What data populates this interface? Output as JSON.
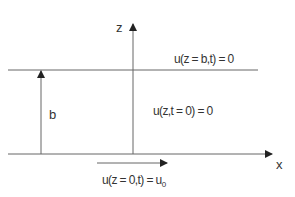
{
  "diagram": {
    "axes": {
      "z_label": "z",
      "x_label": "x"
    },
    "height_label": "b",
    "boundary_conditions": {
      "top": "u(z = b,t) = 0",
      "initial": "u(z,t = 0) = 0",
      "bottom_prefix": "u(z = 0,t) = u",
      "bottom_subscript": "0"
    },
    "colors": {
      "line": "#555555",
      "text": "#333333",
      "background": "#ffffff"
    }
  }
}
